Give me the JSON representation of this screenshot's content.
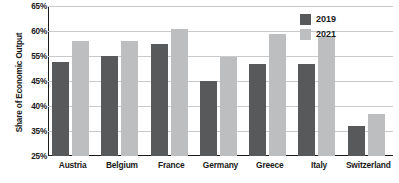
{
  "chart_data": {
    "type": "bar",
    "title": "",
    "xlabel": "",
    "ylabel": "Share of Economic Output",
    "categories": [
      "Austria",
      "Belgium",
      "France",
      "Germany",
      "Greece",
      "Italy",
      "Switzerland"
    ],
    "series": [
      {
        "name": "2019",
        "color": "#58595b",
        "values": [
          52.5,
          55.0,
          57.5,
          45.0,
          52.0,
          52.0,
          36.0
        ]
      },
      {
        "name": "2021",
        "color": "#bcbec0",
        "values": [
          58.0,
          58.0,
          60.5,
          54.5,
          59.5,
          59.0,
          38.5
        ]
      }
    ],
    "ytick_labels": [
      "65%",
      "60%",
      "55%",
      "45%",
      "40%",
      "35%",
      "25%"
    ],
    "ylim": [
      25,
      65
    ],
    "grid": true,
    "legend_position": "top-right"
  }
}
